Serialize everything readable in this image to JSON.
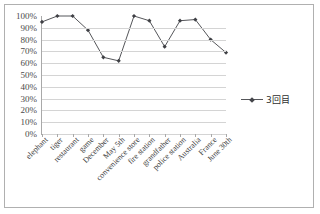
{
  "chart_data": {
    "type": "line",
    "title": "",
    "xlabel": "",
    "ylabel": "",
    "ylim": [
      0,
      100
    ],
    "yticks": [
      "0%",
      "10%",
      "20%",
      "30%",
      "40%",
      "50%",
      "60%",
      "70%",
      "80%",
      "90%",
      "100%"
    ],
    "grid": true,
    "legend_position": "right",
    "categories": [
      "elephant",
      "tiger",
      "restaurant",
      "game",
      "December",
      "May 5th",
      "convenience store",
      "fire station",
      "grandfather",
      "police station",
      "Australia",
      "France",
      "June 30th"
    ],
    "series": [
      {
        "name": "3回目",
        "color": "#55565a",
        "values": [
          95,
          100,
          100,
          88,
          65,
          62,
          100,
          96,
          74,
          96,
          97,
          80,
          69
        ]
      }
    ]
  },
  "legend": {
    "entries": [
      {
        "label": "3回目",
        "marker": "diamond-marker",
        "color": "#55565a"
      }
    ]
  },
  "axes": {
    "y_axis_name": "percentage-axis",
    "x_axis_name": "category-axis"
  }
}
